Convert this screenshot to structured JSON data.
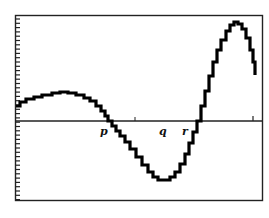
{
  "figure": {
    "type": "function-graph",
    "axis_labels": {
      "p": "p",
      "q": "q",
      "r": "r"
    },
    "colors": {
      "curve": "#000000",
      "frame": "#222222",
      "background": "#ffffff"
    }
  },
  "chart_data": {
    "type": "line",
    "title": "",
    "xlabel": "",
    "ylabel": "",
    "x_tick_labels": [
      "p",
      "q",
      "r"
    ],
    "grid": false,
    "legend": "none",
    "pixel_curve": [
      [
        16,
        106
      ],
      [
        20,
        102
      ],
      [
        26,
        99
      ],
      [
        34,
        97
      ],
      [
        42,
        95
      ],
      [
        52,
        93
      ],
      [
        60,
        92
      ],
      [
        68,
        93
      ],
      [
        76,
        95
      ],
      [
        84,
        98
      ],
      [
        90,
        101
      ],
      [
        96,
        106
      ],
      [
        101,
        111
      ],
      [
        105,
        116
      ],
      [
        108,
        121
      ],
      [
        112,
        126
      ],
      [
        116,
        131
      ],
      [
        120,
        136
      ],
      [
        125,
        142
      ],
      [
        130,
        149
      ],
      [
        136,
        157
      ],
      [
        142,
        165
      ],
      [
        148,
        172
      ],
      [
        153,
        177
      ],
      [
        158,
        180
      ],
      [
        164,
        180
      ],
      [
        170,
        177
      ],
      [
        175,
        172
      ],
      [
        180,
        164
      ],
      [
        185,
        154
      ],
      [
        189,
        143
      ],
      [
        193,
        132
      ],
      [
        197,
        121
      ],
      [
        201,
        106
      ],
      [
        205,
        91
      ],
      [
        209,
        76
      ],
      [
        213,
        62
      ],
      [
        217,
        50
      ],
      [
        221,
        40
      ],
      [
        226,
        31
      ],
      [
        230,
        25
      ],
      [
        234,
        22
      ],
      [
        238,
        24
      ],
      [
        242,
        29
      ],
      [
        246,
        38
      ],
      [
        250,
        50
      ],
      [
        253,
        62
      ],
      [
        255,
        75
      ]
    ]
  }
}
